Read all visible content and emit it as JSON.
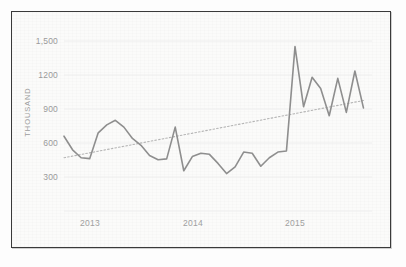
{
  "figure": {
    "frame_color": "#3a3a3a",
    "background_color": "#fbfbfa"
  },
  "axis": {
    "y_title": "THOUSAND",
    "y_ticks": [
      "1,500",
      "1200",
      "900",
      "600",
      "300"
    ],
    "x_ticks": [
      "2013",
      "2014",
      "2015"
    ]
  },
  "chart_data": {
    "type": "line",
    "title": "",
    "subtitle": "",
    "xlabel": "",
    "ylabel": "THOUSAND",
    "ylim": [
      200,
      1560
    ],
    "yticks": [
      300,
      600,
      900,
      1200,
      1500
    ],
    "ytick_labels": [
      "300",
      "600",
      "900",
      "1200",
      "1,500"
    ],
    "xlim": [
      0,
      36
    ],
    "xtick_positions": [
      2.5,
      14.5,
      26.5
    ],
    "xtick_labels": [
      "2013",
      "2014",
      "2015"
    ],
    "grid": true,
    "grid_axis": "y",
    "legend": false,
    "legend_position": "none",
    "units": "thousand",
    "line_color": "#8e8e8e",
    "trend_color": "#b4b4b4",
    "trend_style": "dotted",
    "x": [
      0,
      1,
      2,
      3,
      4,
      5,
      6,
      7,
      8,
      9,
      10,
      11,
      12,
      13,
      14,
      15,
      16,
      17,
      18,
      19,
      20,
      21,
      22,
      23,
      24,
      25,
      26,
      27,
      28,
      29,
      30,
      31,
      32,
      33,
      34,
      35
    ],
    "series": [
      {
        "name": "Monthly value",
        "values": [
          660,
          540,
          470,
          462,
          690,
          760,
          800,
          740,
          640,
          580,
          490,
          452,
          460,
          740,
          355,
          480,
          510,
          500,
          420,
          330,
          390,
          520,
          510,
          395,
          470,
          520,
          530,
          1450,
          920,
          1180,
          1080,
          840,
          1170,
          870,
          1235,
          910
        ]
      }
    ],
    "trendline": {
      "name": "Linear trend",
      "start_value": 470,
      "end_value": 975,
      "x_start": 0,
      "x_end": 35
    },
    "annotations": []
  }
}
